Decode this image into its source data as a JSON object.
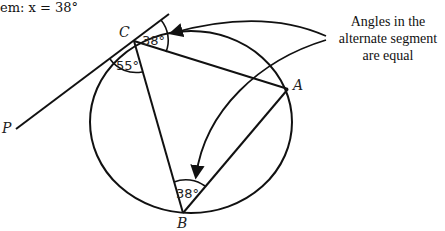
{
  "header": {
    "text": "em: x = 38°"
  },
  "points": {
    "C": {
      "label": "C",
      "x": 134,
      "y": 41
    },
    "A": {
      "label": "A",
      "x": 288,
      "y": 89
    },
    "B": {
      "label": "B",
      "x": 183,
      "y": 213
    },
    "P": {
      "label": "P"
    }
  },
  "angles": {
    "c_alt": "38°",
    "c_tangent": "55°",
    "b": "38°"
  },
  "annotation": {
    "line1": "Angles in the",
    "line2": "alternate segment",
    "line3": "are equal"
  },
  "colors": {
    "stroke": "#111111",
    "background": "#ffffff"
  }
}
